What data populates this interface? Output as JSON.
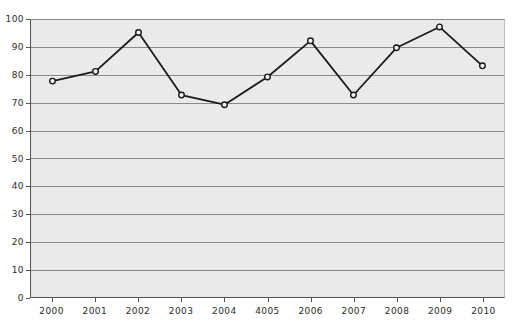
{
  "chart_data": {
    "type": "line",
    "title": "",
    "xlabel": "",
    "ylabel": "",
    "categories": [
      "2000",
      "2001",
      "2002",
      "2003",
      "2004",
      "4005",
      "2006",
      "2007",
      "2008",
      "2009",
      "2010"
    ],
    "values": [
      78,
      81.5,
      95.5,
      73,
      69.5,
      79.5,
      92.5,
      73,
      90,
      97.5,
      83.5
    ],
    "ylim": [
      0,
      100
    ],
    "ytick_labels": [
      "0",
      "10",
      "20",
      "30",
      "40",
      "50",
      "60",
      "70",
      "80",
      "90",
      "100"
    ],
    "ytick_values": [
      0,
      10,
      20,
      30,
      40,
      50,
      60,
      70,
      80,
      90,
      100
    ],
    "grid": "horizontal",
    "legend": "none",
    "marker": "open-circle",
    "line_color": "#1a1a1a",
    "marker_fill": "#f2f2f2",
    "grid_color": "#8a8a8a",
    "plot_background": "#ececed"
  }
}
